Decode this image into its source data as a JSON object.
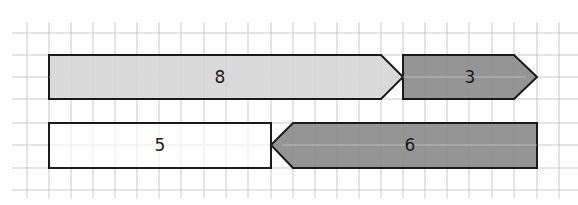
{
  "diagram": {
    "type": "tape-diagram-on-grid",
    "grid": {
      "cell_px": 22,
      "color": "#c8c8c8"
    },
    "rows": [
      {
        "segments": [
          {
            "label": "8",
            "shape": "arrow-right",
            "fill": "#d4d4d4",
            "units": 8
          },
          {
            "label": "3",
            "shape": "arrow-right",
            "fill": "#8a8a8a",
            "units": 3
          }
        ]
      },
      {
        "segments": [
          {
            "label": "5",
            "shape": "rectangle",
            "fill": "#ffffff",
            "units": 5
          },
          {
            "label": "6",
            "shape": "arrow-left",
            "fill": "#8a8a8a",
            "units": 6
          }
        ]
      }
    ]
  }
}
